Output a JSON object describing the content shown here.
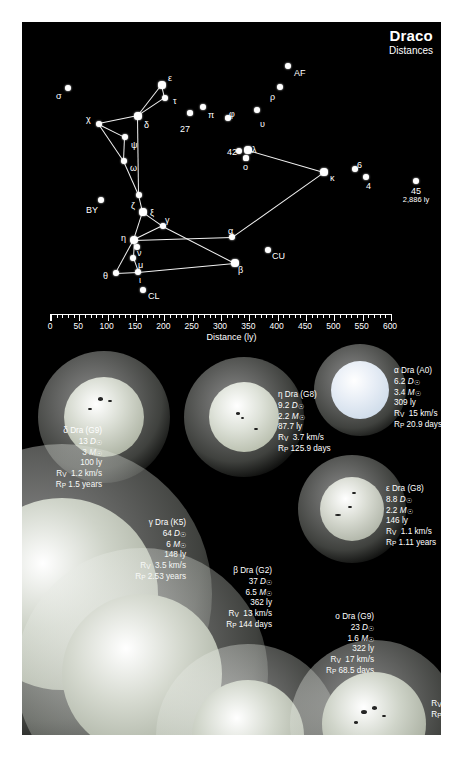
{
  "header": {
    "title": "Draco",
    "subtitle": "Distances"
  },
  "scale": {
    "label": "Distance (ly)",
    "ticks": [
      "0",
      "50",
      "100",
      "150",
      "200",
      "250",
      "300",
      "350",
      "400",
      "450",
      "500",
      "550",
      "600"
    ],
    "min": 0,
    "max": 600
  },
  "map": {
    "stars": [
      {
        "label": "σ",
        "x": 68,
        "y": 88,
        "r": 3.2,
        "lx": 56,
        "ly": 92
      },
      {
        "label": "ε",
        "x": 162,
        "y": 85,
        "r": 3.6,
        "lx": 168,
        "ly": 74
      },
      {
        "label": "τ",
        "x": 165,
        "y": 98,
        "r": 3.2,
        "lx": 173,
        "ly": 97
      },
      {
        "label": "χ",
        "x": 99,
        "y": 124,
        "r": 3.4,
        "lx": 86,
        "ly": 115
      },
      {
        "label": "δ",
        "x": 138,
        "y": 116,
        "r": 3.6,
        "lx": 144,
        "ly": 121
      },
      {
        "label": "27",
        "x": 190,
        "y": 113,
        "r": 2.8,
        "lx": 180,
        "ly": 125
      },
      {
        "label": "π",
        "x": 203,
        "y": 107,
        "r": 3.0,
        "lx": 208,
        "ly": 111
      },
      {
        "label": "φ",
        "x": 228,
        "y": 118,
        "r": 2.8,
        "lx": 229,
        "ly": 110
      },
      {
        "label": "υ",
        "x": 257,
        "y": 110,
        "r": 3.0,
        "lx": 260,
        "ly": 120
      },
      {
        "label": "ρ",
        "x": 280,
        "y": 87,
        "r": 3.0,
        "lx": 270,
        "ly": 93
      },
      {
        "label": "AF",
        "x": 288,
        "y": 66,
        "r": 3.4,
        "lx": 294,
        "ly": 69
      },
      {
        "label": "ψ",
        "x": 125,
        "y": 137,
        "r": 3.0,
        "lx": 131,
        "ly": 141
      },
      {
        "label": "ω",
        "x": 124,
        "y": 161,
        "r": 3.0,
        "lx": 130,
        "ly": 164
      },
      {
        "label": "42",
        "x": 239,
        "y": 151,
        "r": 3.0,
        "lx": 227,
        "ly": 148
      },
      {
        "label": "λ",
        "x": 248,
        "y": 150,
        "r": 3.6,
        "lx": 252,
        "ly": 146
      },
      {
        "label": "ο",
        "x": 246,
        "y": 158,
        "r": 2.6,
        "lx": 243,
        "ly": 163
      },
      {
        "label": "κ",
        "x": 324,
        "y": 172,
        "r": 3.6,
        "lx": 330,
        "ly": 174
      },
      {
        "label": "6",
        "x": 355,
        "y": 169,
        "r": 3.0,
        "lx": 357,
        "ly": 161
      },
      {
        "label": "4",
        "x": 366,
        "y": 177,
        "r": 3.0,
        "lx": 366,
        "ly": 182
      },
      {
        "label": "BY",
        "x": 101,
        "y": 200,
        "r": 3.0,
        "lx": 86,
        "ly": 206
      },
      {
        "label": "ζ",
        "x": 139,
        "y": 195,
        "r": 3.4,
        "lx": 131,
        "ly": 202
      },
      {
        "label": "ξ",
        "x": 143,
        "y": 212,
        "r": 3.6,
        "lx": 150,
        "ly": 209
      },
      {
        "label": "γ",
        "x": 163,
        "y": 226,
        "r": 3.4,
        "lx": 165,
        "ly": 216
      },
      {
        "label": "η",
        "x": 134,
        "y": 240,
        "r": 4.0,
        "lx": 121,
        "ly": 234
      },
      {
        "label": "ν",
        "x": 137,
        "y": 247,
        "r": 3.0,
        "lx": 137,
        "ly": 249
      },
      {
        "label": "α",
        "x": 232,
        "y": 237,
        "r": 3.4,
        "lx": 228,
        "ly": 227
      },
      {
        "label": "CU",
        "x": 268,
        "y": 250,
        "r": 3.2,
        "lx": 272,
        "ly": 252
      },
      {
        "label": "β",
        "x": 235,
        "y": 263,
        "r": 3.6,
        "lx": 238,
        "ly": 266
      },
      {
        "label": "μ",
        "x": 133,
        "y": 258,
        "r": 3.0,
        "lx": 138,
        "ly": 261
      },
      {
        "label": "θ",
        "x": 116,
        "y": 273,
        "r": 3.2,
        "lx": 103,
        "ly": 272
      },
      {
        "label": "ι",
        "x": 138,
        "y": 272,
        "r": 3.4,
        "lx": 139,
        "ly": 276
      },
      {
        "label": "CL",
        "x": 143,
        "y": 290,
        "r": 3.0,
        "lx": 148,
        "ly": 292
      }
    ],
    "far_star": {
      "name": "45",
      "distance": "2,886 ly",
      "x": 416,
      "y": 181
    }
  },
  "stars_detail": [
    {
      "id": "alpha",
      "name": "α Dra (A0)",
      "diameter": "6.2",
      "diameter_unit": "D",
      "mass": "3.4",
      "mass_unit": "M",
      "distance": "309 ly",
      "rv_label": "R",
      "rv_sub": "V",
      "rv": "15 km/s",
      "rp_label": "R",
      "rp_sub": "P",
      "rp": "20.9 days"
    },
    {
      "id": "eta",
      "name": "η Dra (G8)",
      "diameter": "9.2",
      "diameter_unit": "D",
      "mass": "2.2",
      "mass_unit": "M",
      "distance": "87.7 ly",
      "rv_label": "R",
      "rv_sub": "V",
      "rv": "3.7 km/s",
      "rp_label": "R",
      "rp_sub": "P",
      "rp": "125.9 days"
    },
    {
      "id": "delta",
      "name": "δ Dra (G9)",
      "diameter": "13",
      "diameter_unit": "D",
      "mass": "3",
      "mass_unit": "M",
      "distance": "100 ly",
      "rv_label": "R",
      "rv_sub": "V",
      "rv": "1.2 km/s",
      "rp_label": "R",
      "rp_sub": "P",
      "rp": "1.5 years"
    },
    {
      "id": "epsilon",
      "name": "ε Dra (G8)",
      "diameter": "8.8",
      "diameter_unit": "D",
      "mass": "2.2",
      "mass_unit": "M",
      "distance": "146 ly",
      "rv_label": "R",
      "rv_sub": "V",
      "rv": "1.1 km/s",
      "rp_label": "R",
      "rp_sub": "P",
      "rp": "1.11 years"
    },
    {
      "id": "gamma",
      "name": "γ Dra (K5)",
      "diameter": "64",
      "diameter_unit": "D",
      "mass": "6",
      "mass_unit": "M",
      "distance": "148 ly",
      "rv_label": "R",
      "rv_sub": "V",
      "rv": "3.5 km/s",
      "rp_label": "R",
      "rp_sub": "P",
      "rp": "2.53 years"
    },
    {
      "id": "beta",
      "name": "β Dra (G2)",
      "diameter": "37",
      "diameter_unit": "D",
      "mass": "6.5",
      "mass_unit": "M",
      "distance": "362 ly",
      "rv_label": "R",
      "rv_sub": "V",
      "rv": "13 km/s",
      "rp_label": "R",
      "rp_sub": "P",
      "rp": "144 days"
    },
    {
      "id": "omicron",
      "name": "ο Dra (G9)",
      "diameter": "23",
      "diameter_unit": "D",
      "mass": "1.6",
      "mass_unit": "M",
      "distance": "322 ly",
      "rv_label": "R",
      "rv_sub": "V",
      "rv": "17 km/s",
      "rp_label": "R",
      "rp_sub": "P",
      "rp": "68.5 days"
    },
    {
      "id": "iota",
      "name": "ι Dra (K2)",
      "diameter": "13.5",
      "diameter_unit": "D",
      "mass": "2.8",
      "mass_unit": "M",
      "distance": "103 ly",
      "rv_label": "R",
      "rv_sub": "V",
      "rv": "2.8 km/s",
      "rp_label": "R",
      "rp_sub": "P",
      "rp": "244 days"
    }
  ],
  "colors": {
    "background": "#000000",
    "star": "#ffffff",
    "page": "#ffffff"
  }
}
